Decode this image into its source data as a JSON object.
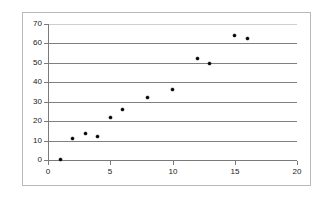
{
  "chart_data": {
    "type": "scatter",
    "title": "",
    "subtitle": "",
    "xlabel": "",
    "ylabel": "",
    "xlim": [
      0,
      20
    ],
    "ylim": [
      0,
      70
    ],
    "x_ticks": [
      0,
      5,
      10,
      15,
      20
    ],
    "y_ticks": [
      0,
      10,
      20,
      30,
      40,
      50,
      60,
      70
    ],
    "grid": "horizontal",
    "legend": "none",
    "series": [
      {
        "name": "Series 1",
        "marker": "filled-diamond",
        "color": "#000000",
        "points": [
          {
            "x": 1,
            "y": 0.3
          },
          {
            "x": 2,
            "y": 11
          },
          {
            "x": 3,
            "y": 13.5
          },
          {
            "x": 4,
            "y": 12
          },
          {
            "x": 5,
            "y": 21.8
          },
          {
            "x": 6,
            "y": 26
          },
          {
            "x": 8,
            "y": 32.4
          },
          {
            "x": 10,
            "y": 36.4
          },
          {
            "x": 12,
            "y": 52
          },
          {
            "x": 13,
            "y": 49.6
          },
          {
            "x": 15,
            "y": 64
          },
          {
            "x": 16,
            "y": 62.5
          }
        ]
      }
    ]
  },
  "colors": {
    "gridline": "#808080",
    "axis": "#7a7a7a",
    "frame": "#b9b9b9",
    "marker": "#000000",
    "tick_label": "#1a1a1a",
    "background": "#ffffff"
  }
}
